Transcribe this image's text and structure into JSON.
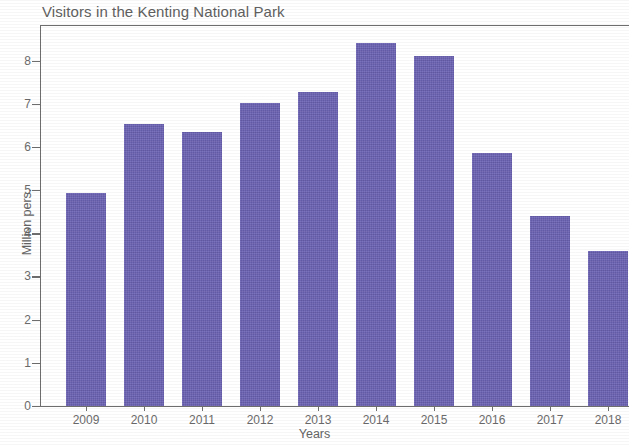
{
  "chart_data": {
    "type": "bar",
    "title": "Visitors in the Kenting National Park",
    "xlabel": "Years",
    "ylabel": "Million pers.",
    "categories": [
      "2009",
      "2010",
      "2011",
      "2012",
      "2013",
      "2014",
      "2015",
      "2016",
      "2017",
      "2018"
    ],
    "values": [
      4.93,
      6.52,
      6.35,
      7.02,
      7.27,
      8.4,
      8.1,
      5.87,
      4.4,
      3.58
    ],
    "ylim": [
      0,
      8.8
    ],
    "yticks": [
      0,
      1,
      2,
      3,
      4,
      5,
      6,
      7,
      8
    ],
    "ytick_labels": [
      "0",
      "1",
      "2",
      "3",
      "4",
      "5",
      "6",
      "7",
      "8"
    ],
    "grid": false,
    "legend": null,
    "bar_color": "#6c63b5",
    "axis_color": "#6e6e6e",
    "text_color": "#6b6b6b"
  },
  "figure": {
    "background": "#ffffff",
    "title": "Visitors in the Kenting National Park"
  }
}
